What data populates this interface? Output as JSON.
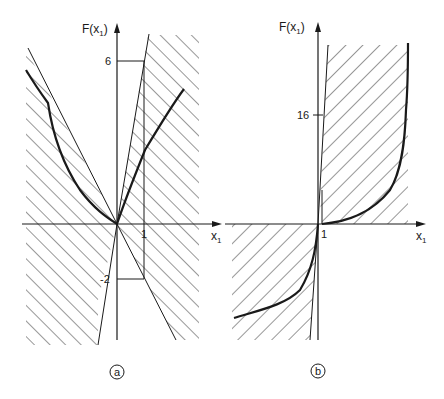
{
  "figure": {
    "panels": [
      {
        "id": "a",
        "label": "a",
        "y_axis_label": "F(x",
        "y_axis_sub": "1",
        "y_axis_close": ")",
        "x_axis_label": "x",
        "x_axis_sub": "1",
        "x_tick": "1",
        "y_ticks": [
          "6",
          "-2"
        ]
      },
      {
        "id": "b",
        "label": "b",
        "y_axis_label": "F(x",
        "y_axis_sub": "1",
        "y_axis_close": ")",
        "x_axis_label": "x",
        "x_axis_sub": "1",
        "x_tick": "1",
        "y_ticks": [
          "16"
        ]
      }
    ],
    "colors": {
      "ink": "#1a1a1a",
      "background": "#ffffff"
    }
  }
}
